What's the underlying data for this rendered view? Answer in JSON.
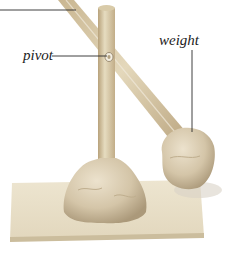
{
  "figure": {
    "labels": {
      "pivot": "pivot",
      "weight": "weight"
    },
    "colors": {
      "wood_light": "#e3d7b8",
      "wood_mid": "#cdbb96",
      "wood_dark": "#b09a73",
      "clay_light": "#e6dac4",
      "clay_mid": "#d2c3a6",
      "clay_dark": "#a99779",
      "board": "#efe7d2",
      "leader_line": "#2a2a2a"
    }
  }
}
